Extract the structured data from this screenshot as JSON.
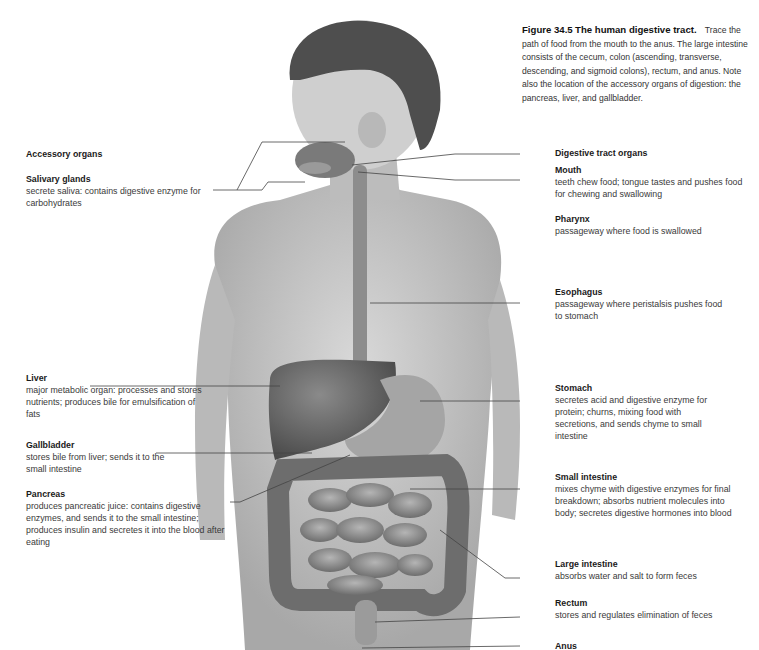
{
  "figure": {
    "number": "Figure 34.5",
    "title": "The human digestive tract.",
    "caption": "Trace the path of food from the mouth to the anus. The large intestine consists of the cecum, colon (ascending, transverse, descending, and sigmoid colons), rectum, and anus. Note also the location of the accessory organs of digestion: the pancreas, liver, and gallbladder."
  },
  "left": {
    "heading": "Accessory organs",
    "items": [
      {
        "name": "Salivary glands",
        "desc": "secrete saliva: contains digestive enzyme for carbohydrates"
      },
      {
        "name": "Liver",
        "desc": "major metabolic organ: processes and stores nutrients; produces bile for emulsification of fats"
      },
      {
        "name": "Gallbladder",
        "desc": "stores bile from liver; sends it to the small intestine"
      },
      {
        "name": "Pancreas",
        "desc": "produces pancreatic juice: contains digestive enzymes, and sends it to the small intestine; produces insulin and secretes it into the blood after eating"
      }
    ]
  },
  "right": {
    "heading": "Digestive tract organs",
    "items": [
      {
        "name": "Mouth",
        "desc": "teeth chew food; tongue tastes and pushes food for chewing and swallowing"
      },
      {
        "name": "Pharynx",
        "desc": "passageway where food is swallowed"
      },
      {
        "name": "Esophagus",
        "desc": "passageway where peristalsis pushes food to stomach"
      },
      {
        "name": "Stomach",
        "desc": "secretes acid and digestive enzyme for protein; churns, mixing food with secretions, and sends chyme to small intestine"
      },
      {
        "name": "Small intestine",
        "desc": "mixes chyme with digestive enzymes for final breakdown; absorbs nutrient molecules into body; secretes digestive hormones into blood"
      },
      {
        "name": "Large intestine",
        "desc": "absorbs water and salt to form feces"
      },
      {
        "name": "Rectum",
        "desc": "stores and regulates elimination of feces"
      },
      {
        "name": "Anus",
        "desc": ""
      }
    ]
  }
}
